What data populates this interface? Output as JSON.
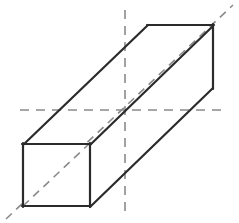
{
  "figure": {
    "type": "geometry-diagram",
    "canvas": {
      "width": 239,
      "height": 223,
      "background": "#ffffff"
    },
    "styles": {
      "solid_edge_color": "#2b2b2b",
      "solid_edge_width": 2.2,
      "dashed_line_color": "#8a8a8a",
      "dashed_line_width": 1.6,
      "face_fill_color": "#ffffff"
    },
    "vertices": {
      "front_top_left": [
        23,
        144
      ],
      "front_top_right": [
        90,
        144
      ],
      "front_bottom_left": [
        23,
        206
      ],
      "front_bottom_right": [
        90,
        206
      ],
      "back_top_left": [
        148,
        25
      ],
      "back_top_right": [
        213,
        25
      ],
      "back_bottom_right": [
        213,
        88
      ],
      "back_bottom_left": [
        146,
        88
      ]
    },
    "solid_edges": [
      {
        "name": "front-face-top",
        "from": [
          23,
          144
        ],
        "to": [
          90,
          144
        ]
      },
      {
        "name": "front-face-right",
        "from": [
          90,
          144
        ],
        "to": [
          90,
          206
        ]
      },
      {
        "name": "front-face-bottom",
        "from": [
          23,
          206
        ],
        "to": [
          90,
          206
        ]
      },
      {
        "name": "front-face-left",
        "from": [
          23,
          144
        ],
        "to": [
          23,
          206
        ]
      },
      {
        "name": "top-face-left-receding",
        "from": [
          23,
          144
        ],
        "to": [
          148,
          25
        ]
      },
      {
        "name": "top-face-right-receding",
        "from": [
          90,
          144
        ],
        "to": [
          213,
          25
        ]
      },
      {
        "name": "back-face-top",
        "from": [
          148,
          25
        ],
        "to": [
          213,
          25
        ]
      },
      {
        "name": "back-face-right",
        "from": [
          213,
          25
        ],
        "to": [
          213,
          88
        ]
      },
      {
        "name": "bottom-right-receding",
        "from": [
          90,
          206
        ],
        "to": [
          213,
          88
        ]
      }
    ],
    "dashed_lines": [
      {
        "name": "horizontal-axis",
        "from": [
          20,
          110
        ],
        "to": [
          226,
          110
        ]
      },
      {
        "name": "vertical-axis",
        "from": [
          125,
          10
        ],
        "to": [
          125,
          214
        ]
      },
      {
        "name": "body-diagonal",
        "from": [
          6,
          219
        ],
        "to": [
          233,
          5
        ]
      }
    ],
    "labels": []
  }
}
